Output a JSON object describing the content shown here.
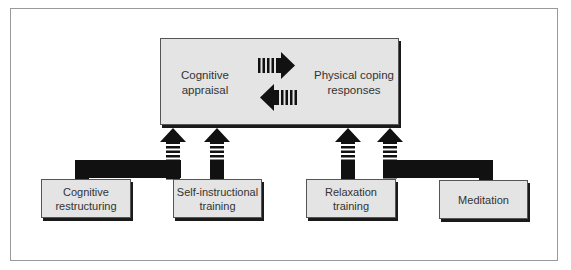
{
  "diagram": {
    "type": "flow",
    "center_box": {
      "left_label": "Cognitive appraisal",
      "left_label_lines": [
        "Cognitive",
        "appraisal"
      ],
      "right_label": "Physical coping responses",
      "right_label_lines": [
        "Physical coping",
        "responses"
      ],
      "arrows": [
        {
          "direction": "right",
          "from": "Cognitive appraisal",
          "to": "Physical coping responses"
        },
        {
          "direction": "left",
          "from": "Physical coping responses",
          "to": "Cognitive appraisal"
        }
      ]
    },
    "techniques": [
      {
        "id": "cognitive-restructuring",
        "label_lines": [
          "Cognitive",
          "restructuring"
        ],
        "feeds": "Cognitive appraisal"
      },
      {
        "id": "self-instructional-training",
        "label_lines": [
          "Self-instructional",
          "training"
        ],
        "feeds": "Cognitive appraisal"
      },
      {
        "id": "relaxation-training",
        "label_lines": [
          "Relaxation",
          "training"
        ],
        "feeds": "Physical coping responses"
      },
      {
        "id": "meditation",
        "label_lines": [
          "Meditation"
        ],
        "feeds": "Physical coping responses"
      }
    ],
    "colors": {
      "box_fill": "#e4e4e4",
      "arrow_fill": "#111111",
      "frame": "#9a9a9a",
      "shadow": "#1a1a1a"
    }
  }
}
